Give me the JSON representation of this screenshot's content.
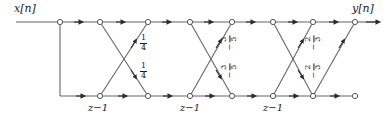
{
  "figure": {
    "type": "signal-flow-graph",
    "input_label": "x[n]",
    "output_label": "y[n]",
    "delay_label": "z−1",
    "delay_count": 3,
    "line_color": "#555555",
    "text_color": "#1a1a1a",
    "node_fill": "#ffffff"
  },
  "stages": [
    {
      "index": 1,
      "upper_coefficient": {
        "sign": "",
        "numerator": "1",
        "denominator": "4"
      },
      "lower_coefficient": {
        "sign": "",
        "numerator": "1",
        "denominator": "4"
      }
    },
    {
      "index": 2,
      "upper_coefficient": {
        "sign": "−",
        "numerator": "3",
        "denominator": "5"
      },
      "lower_coefficient": {
        "sign": "−",
        "numerator": "3",
        "denominator": "5"
      }
    },
    {
      "index": 3,
      "upper_coefficient": {
        "sign": "−",
        "numerator": "2",
        "denominator": "3"
      },
      "lower_coefficient": {
        "sign": "−",
        "numerator": "2",
        "denominator": "3"
      }
    }
  ],
  "delays": [
    {
      "index": 1,
      "label": "z−1"
    },
    {
      "index": 2,
      "label": "z−1"
    },
    {
      "index": 3,
      "label": "z−1"
    }
  ]
}
